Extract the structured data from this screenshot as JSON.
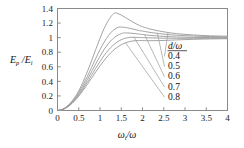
{
  "chart_data": {
    "type": "line",
    "title": "",
    "subtitle": "",
    "xlabel": "ωᵢ/ω",
    "xlabel_base": "ω",
    "xlabel_sub": "i",
    "xlabel_tail": "/ω",
    "ylabel": "Eₚ/Eᵢ",
    "ylabel_base": "E",
    "ylabel_sub1": "p",
    "ylabel_mid": "/E",
    "ylabel_sub2": "i",
    "xlim": [
      0,
      4
    ],
    "ylim": [
      0,
      1.4
    ],
    "grid": false,
    "legend_position": "right-inside",
    "legend_title": "d/ω",
    "legend_title_num": "d",
    "legend_title_den": "/ω",
    "xticks": [
      "0",
      "0.5",
      "1",
      "1.5",
      "2",
      "2.5",
      "3",
      "3.5",
      "4"
    ],
    "xtick_values": [
      0,
      0.5,
      1,
      1.5,
      2,
      2.5,
      3,
      3.5,
      4
    ],
    "yticks": [
      "0",
      "0.2",
      "0.4",
      "0.6",
      "0.8",
      "1",
      "1.2",
      "1.4"
    ],
    "ytick_values": [
      0,
      0.2,
      0.4,
      0.6,
      0.8,
      1,
      1.2,
      1.4
    ],
    "series": [
      {
        "name": "0.4",
        "label": "0.4",
        "peak_x": 1.35,
        "peak_y": 1.34,
        "end_y": 1.02,
        "points": [
          [
            0.0,
            0.0
          ],
          [
            0.1,
            0.012
          ],
          [
            0.2,
            0.045
          ],
          [
            0.3,
            0.1
          ],
          [
            0.4,
            0.175
          ],
          [
            0.5,
            0.27
          ],
          [
            0.6,
            0.39
          ],
          [
            0.7,
            0.53
          ],
          [
            0.8,
            0.68
          ],
          [
            0.9,
            0.84
          ],
          [
            1.0,
            0.99
          ],
          [
            1.1,
            1.13
          ],
          [
            1.2,
            1.24
          ],
          [
            1.3,
            1.32
          ],
          [
            1.35,
            1.34
          ],
          [
            1.4,
            1.335
          ],
          [
            1.5,
            1.31
          ],
          [
            1.6,
            1.275
          ],
          [
            1.7,
            1.24
          ],
          [
            1.8,
            1.205
          ],
          [
            1.9,
            1.175
          ],
          [
            2.0,
            1.15
          ],
          [
            2.2,
            1.115
          ],
          [
            2.4,
            1.09
          ],
          [
            2.6,
            1.07
          ],
          [
            2.8,
            1.055
          ],
          [
            3.0,
            1.045
          ],
          [
            3.2,
            1.037
          ],
          [
            3.4,
            1.03
          ],
          [
            3.6,
            1.025
          ],
          [
            3.8,
            1.022
          ],
          [
            4.0,
            1.02
          ]
        ]
      },
      {
        "name": "0.5",
        "label": "0.5",
        "peak_x": 1.45,
        "peak_y": 1.145,
        "end_y": 1.01,
        "points": [
          [
            0.0,
            0.0
          ],
          [
            0.1,
            0.011
          ],
          [
            0.2,
            0.042
          ],
          [
            0.3,
            0.093
          ],
          [
            0.4,
            0.162
          ],
          [
            0.5,
            0.248
          ],
          [
            0.6,
            0.35
          ],
          [
            0.7,
            0.465
          ],
          [
            0.8,
            0.59
          ],
          [
            0.9,
            0.715
          ],
          [
            1.0,
            0.835
          ],
          [
            1.1,
            0.94
          ],
          [
            1.2,
            1.03
          ],
          [
            1.3,
            1.095
          ],
          [
            1.4,
            1.135
          ],
          [
            1.45,
            1.145
          ],
          [
            1.5,
            1.145
          ],
          [
            1.6,
            1.14
          ],
          [
            1.7,
            1.128
          ],
          [
            1.8,
            1.115
          ],
          [
            1.9,
            1.1
          ],
          [
            2.0,
            1.09
          ],
          [
            2.2,
            1.07
          ],
          [
            2.4,
            1.055
          ],
          [
            2.6,
            1.042
          ],
          [
            2.8,
            1.033
          ],
          [
            3.0,
            1.027
          ],
          [
            3.2,
            1.022
          ],
          [
            3.4,
            1.018
          ],
          [
            3.6,
            1.015
          ],
          [
            3.8,
            1.012
          ],
          [
            4.0,
            1.01
          ]
        ]
      },
      {
        "name": "0.6",
        "label": "0.6",
        "peak_x": 1.55,
        "peak_y": 1.065,
        "end_y": 1.0,
        "points": [
          [
            0.0,
            0.0
          ],
          [
            0.1,
            0.01
          ],
          [
            0.2,
            0.039
          ],
          [
            0.3,
            0.086
          ],
          [
            0.4,
            0.15
          ],
          [
            0.5,
            0.228
          ],
          [
            0.6,
            0.32
          ],
          [
            0.7,
            0.423
          ],
          [
            0.8,
            0.532
          ],
          [
            0.9,
            0.641
          ],
          [
            1.0,
            0.745
          ],
          [
            1.1,
            0.84
          ],
          [
            1.2,
            0.92
          ],
          [
            1.3,
            0.983
          ],
          [
            1.4,
            1.028
          ],
          [
            1.5,
            1.055
          ],
          [
            1.55,
            1.063
          ],
          [
            1.6,
            1.065
          ],
          [
            1.7,
            1.063
          ],
          [
            1.8,
            1.057
          ],
          [
            1.9,
            1.05
          ],
          [
            2.0,
            1.043
          ],
          [
            2.2,
            1.03
          ],
          [
            2.4,
            1.021
          ],
          [
            2.6,
            1.014
          ],
          [
            2.8,
            1.009
          ],
          [
            3.0,
            1.006
          ],
          [
            3.2,
            1.004
          ],
          [
            3.4,
            1.002
          ],
          [
            3.6,
            1.001
          ],
          [
            3.8,
            1.0
          ],
          [
            4.0,
            1.0
          ]
        ]
      },
      {
        "name": "0.7",
        "label": "0.7",
        "peak_x": 1.7,
        "peak_y": 1.005,
        "end_y": 0.992,
        "points": [
          [
            0.0,
            0.0
          ],
          [
            0.1,
            0.0095
          ],
          [
            0.2,
            0.036
          ],
          [
            0.3,
            0.08
          ],
          [
            0.4,
            0.139
          ],
          [
            0.5,
            0.211
          ],
          [
            0.6,
            0.294
          ],
          [
            0.7,
            0.386
          ],
          [
            0.8,
            0.483
          ],
          [
            0.9,
            0.58
          ],
          [
            1.0,
            0.672
          ],
          [
            1.1,
            0.757
          ],
          [
            1.2,
            0.831
          ],
          [
            1.3,
            0.892
          ],
          [
            1.4,
            0.939
          ],
          [
            1.5,
            0.972
          ],
          [
            1.6,
            0.993
          ],
          [
            1.7,
            1.004
          ],
          [
            1.8,
            1.005
          ],
          [
            1.9,
            1.003
          ],
          [
            2.0,
            1.0
          ],
          [
            2.2,
            0.997
          ],
          [
            2.4,
            0.994
          ],
          [
            2.6,
            0.992
          ],
          [
            2.8,
            0.991
          ],
          [
            3.0,
            0.991
          ],
          [
            3.2,
            0.991
          ],
          [
            3.4,
            0.991
          ],
          [
            3.6,
            0.992
          ],
          [
            3.8,
            0.992
          ],
          [
            4.0,
            0.992
          ]
        ]
      },
      {
        "name": "0.8",
        "label": "0.8",
        "peak_x": 1.9,
        "peak_y": 0.96,
        "end_y": 0.985,
        "points": [
          [
            0.0,
            0.0
          ],
          [
            0.1,
            0.009
          ],
          [
            0.2,
            0.034
          ],
          [
            0.3,
            0.075
          ],
          [
            0.4,
            0.13
          ],
          [
            0.5,
            0.197
          ],
          [
            0.6,
            0.273
          ],
          [
            0.7,
            0.356
          ],
          [
            0.8,
            0.443
          ],
          [
            0.9,
            0.53
          ],
          [
            1.0,
            0.613
          ],
          [
            1.1,
            0.69
          ],
          [
            1.2,
            0.759
          ],
          [
            1.3,
            0.818
          ],
          [
            1.4,
            0.866
          ],
          [
            1.5,
            0.903
          ],
          [
            1.6,
            0.93
          ],
          [
            1.7,
            0.947
          ],
          [
            1.8,
            0.957
          ],
          [
            1.9,
            0.96
          ],
          [
            2.0,
            0.96
          ],
          [
            2.2,
            0.958
          ],
          [
            2.4,
            0.96
          ],
          [
            2.6,
            0.964
          ],
          [
            2.8,
            0.969
          ],
          [
            3.0,
            0.973
          ],
          [
            3.2,
            0.977
          ],
          [
            3.4,
            0.98
          ],
          [
            3.6,
            0.982
          ],
          [
            3.8,
            0.984
          ],
          [
            4.0,
            0.985
          ]
        ]
      }
    ],
    "leader_lines": [
      {
        "series": "0.4",
        "from_x": 2.6,
        "from_y": 1.07,
        "to_label": "0.4"
      },
      {
        "series": "0.5",
        "from_x": 2.35,
        "from_y": 1.063,
        "to_label": "0.5"
      },
      {
        "series": "0.6",
        "from_x": 2.05,
        "from_y": 1.04,
        "to_label": "0.6"
      },
      {
        "series": "0.7",
        "from_x": 1.8,
        "from_y": 1.005,
        "to_label": "0.7"
      },
      {
        "series": "0.8",
        "from_x": 1.6,
        "from_y": 0.93,
        "to_label": "0.8"
      }
    ]
  },
  "colors": {
    "curve": "#9a9a9a",
    "frame": "#8a8a8a",
    "text": "#111111",
    "background": "#ffffff"
  }
}
